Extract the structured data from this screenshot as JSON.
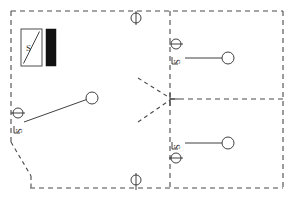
{
  "drawing": {
    "type": "electrical-floor-plan",
    "canvas": {
      "width": 294,
      "height": 199
    },
    "background_color": "#ffffff",
    "wall_color": "#4a4a4a",
    "line_color": "#2b2b2b",
    "fill_color": "#111111"
  },
  "labels": {
    "panel_label": "S",
    "switch_label_1": "S",
    "switch_label_2": "S",
    "switch_label_3": "S"
  },
  "symbols": {
    "panel": {
      "name": "distribution-panel",
      "x": 21,
      "y": 29,
      "width": 21,
      "height": 37
    },
    "panel_bar": {
      "name": "panel-busbar",
      "x": 46,
      "y": 29,
      "width": 10,
      "height": 37
    },
    "ceiling_fixture_top": {
      "name": "ceiling-fixture-top",
      "cx": 136,
      "cy": 18,
      "r": 5
    },
    "ceiling_fixture_bottom": {
      "name": "ceiling-fixture-bottom",
      "cx": 136,
      "cy": 180,
      "r": 5
    },
    "switch_left": {
      "name": "wall-switch-left",
      "cx": 18,
      "cy": 113,
      "r": 5
    },
    "switch_topright": {
      "name": "wall-switch-top-right",
      "cx": 178,
      "cy": 44,
      "r": 5
    },
    "switch_bottomright": {
      "name": "wall-switch-bottom-right",
      "cx": 178,
      "cy": 155,
      "r": 5
    },
    "lamp_left": {
      "name": "lamp-left",
      "cx": 92,
      "cy": 98,
      "r": 6
    },
    "lamp_topright": {
      "name": "lamp-top-right",
      "cx": 228,
      "cy": 54,
      "r": 6
    },
    "lamp_bottomright": {
      "name": "lamp-bottom-right",
      "cx": 228,
      "cy": 144,
      "r": 6
    }
  },
  "walls": {
    "outer_top": "M 11 11 L 283 11",
    "outer_right": "M 283 11 L 283 188",
    "outer_bottom": "M 11 188 L 283 188",
    "outer_left_upper": "M 11 11 L 11 142",
    "outer_left_chamfer": "M 11 142 L 30 175",
    "outer_bottom_left": "M 30 175 L 30 188",
    "partition_vertical": "M 170 11 L 170 188",
    "partition_horizontal": "M 170 99 L 283 99"
  },
  "door_swing": {
    "name": "double-door-swing",
    "upper": "M 137 78 L 170 99",
    "lower": "M 137 122 L 170 99"
  },
  "circuits": [
    {
      "name": "circuit-left",
      "path": "M 24 122 L 92 98"
    },
    {
      "name": "circuit-top-right",
      "path": "M 183 54 L 222 54"
    },
    {
      "name": "circuit-bottom-right",
      "path": "M 183 144 L 222 144"
    }
  ]
}
